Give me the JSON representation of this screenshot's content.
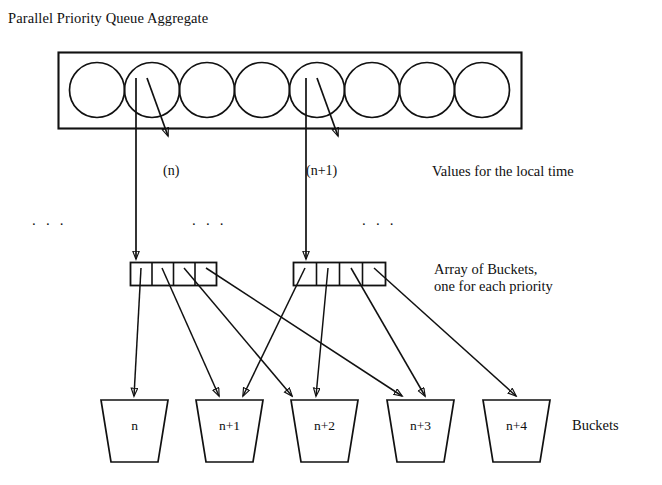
{
  "figure": {
    "title": "Parallel Priority Queue Aggregate",
    "background_color": "#ffffff",
    "stroke_color": "#111111"
  },
  "aggregate_box": {
    "name": "Parallel Priority Queue Aggregate",
    "circle_count": 8,
    "circles": [
      {
        "index": 0
      },
      {
        "index": 1
      },
      {
        "index": 2
      },
      {
        "index": 3
      },
      {
        "index": 4
      },
      {
        "index": 5
      },
      {
        "index": 6
      },
      {
        "index": 7
      }
    ]
  },
  "local_time_values": {
    "labels": [
      "(n)",
      "(n+1)"
    ],
    "caption": "Values for the local time"
  },
  "ellipses": {
    "left": ". . .",
    "middle": ". . .",
    "right": ". . ."
  },
  "bucket_arrays": {
    "caption_line1": "Array of Buckets,",
    "caption_line2": "one for each priority",
    "arrays": [
      {
        "name": "array-n",
        "cells": 4
      },
      {
        "name": "array-n-plus-1",
        "cells": 4
      }
    ]
  },
  "buckets": {
    "caption": "Buckets",
    "items": [
      {
        "label": "n"
      },
      {
        "label": "n+1"
      },
      {
        "label": "n+2"
      },
      {
        "label": "n+3"
      },
      {
        "label": "n+4"
      }
    ]
  }
}
